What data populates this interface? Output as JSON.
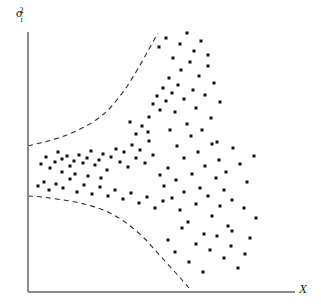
{
  "figure": {
    "width": 321,
    "height": 308,
    "background_color": "#ffffff"
  },
  "axes": {
    "y_axis": {
      "label_symbol": "σ",
      "label_superscript": "2",
      "label_subscript": "i",
      "label_full": "σ²ᵢ",
      "x": 28,
      "top": 32,
      "bottom": 292,
      "color": "#8a8a8a"
    },
    "x_axis": {
      "label": "X",
      "y": 292,
      "left": 28,
      "right": 295,
      "color": "#8a8a8a"
    }
  },
  "chart_data": {
    "type": "scatter",
    "title": "",
    "subtitle": "",
    "xlabel": "X",
    "ylabel": "σ²ᵢ",
    "xlim": [
      28,
      295
    ],
    "ylim": [
      292,
      32
    ],
    "grid": false,
    "legend": null,
    "annotations": [],
    "point_color": "#111111",
    "point_size": 3,
    "envelopes": {
      "style": "dashed",
      "color": "#2b2b2b",
      "upper": {
        "name": "upper-envelope",
        "points": [
          [
            28,
            146
          ],
          [
            40,
            143
          ],
          [
            52,
            140
          ],
          [
            64,
            136
          ],
          [
            76,
            131
          ],
          [
            88,
            125
          ],
          [
            100,
            117
          ],
          [
            110,
            108
          ],
          [
            120,
            96
          ],
          [
            128,
            85
          ],
          [
            136,
            72
          ],
          [
            143,
            60
          ],
          [
            149,
            49
          ],
          [
            154,
            40
          ],
          [
            158,
            33
          ]
        ]
      },
      "lower": {
        "name": "lower-envelope",
        "points": [
          [
            28,
            196
          ],
          [
            42,
            197
          ],
          [
            56,
            199
          ],
          [
            70,
            201
          ],
          [
            84,
            204
          ],
          [
            98,
            208
          ],
          [
            110,
            213
          ],
          [
            122,
            220
          ],
          [
            134,
            229
          ],
          [
            145,
            239
          ],
          [
            155,
            250
          ],
          [
            165,
            261
          ],
          [
            174,
            271
          ],
          [
            182,
            280
          ],
          [
            189,
            288
          ]
        ]
      }
    },
    "points": [
      [
        41,
        164
      ],
      [
        46,
        157
      ],
      [
        50,
        168
      ],
      [
        55,
        162
      ],
      [
        58,
        152
      ],
      [
        62,
        159
      ],
      [
        67,
        156
      ],
      [
        70,
        166
      ],
      [
        74,
        161
      ],
      [
        79,
        155
      ],
      [
        83,
        163
      ],
      [
        87,
        158
      ],
      [
        91,
        151
      ],
      [
        95,
        165
      ],
      [
        99,
        160
      ],
      [
        103,
        154
      ],
      [
        107,
        170
      ],
      [
        111,
        157
      ],
      [
        116,
        149
      ],
      [
        120,
        162
      ],
      [
        124,
        152
      ],
      [
        128,
        167
      ],
      [
        132,
        145
      ],
      [
        136,
        158
      ],
      [
        140,
        150
      ],
      [
        145,
        163
      ],
      [
        149,
        141
      ],
      [
        153,
        155
      ],
      [
        38,
        186
      ],
      [
        44,
        182
      ],
      [
        49,
        190
      ],
      [
        56,
        184
      ],
      [
        63,
        188
      ],
      [
        70,
        179
      ],
      [
        77,
        192
      ],
      [
        84,
        185
      ],
      [
        92,
        194
      ],
      [
        100,
        187
      ],
      [
        108,
        196
      ],
      [
        115,
        190
      ],
      [
        123,
        199
      ],
      [
        131,
        193
      ],
      [
        139,
        203
      ],
      [
        147,
        197
      ],
      [
        155,
        208
      ],
      [
        163,
        201
      ],
      [
        149,
        117
      ],
      [
        153,
        104
      ],
      [
        157,
        96
      ],
      [
        160,
        110
      ],
      [
        163,
        88
      ],
      [
        166,
        101
      ],
      [
        169,
        78
      ],
      [
        172,
        93
      ],
      [
        175,
        112
      ],
      [
        178,
        85
      ],
      [
        181,
        70
      ],
      [
        184,
        99
      ],
      [
        187,
        124
      ],
      [
        190,
        62
      ],
      [
        193,
        90
      ],
      [
        196,
        108
      ],
      [
        199,
        76
      ],
      [
        202,
        130
      ],
      [
        205,
        95
      ],
      [
        208,
        55
      ],
      [
        211,
        118
      ],
      [
        214,
        83
      ],
      [
        217,
        142
      ],
      [
        220,
        102
      ],
      [
        159,
        47
      ],
      [
        166,
        38
      ],
      [
        173,
        58
      ],
      [
        180,
        44
      ],
      [
        187,
        33
      ],
      [
        194,
        51
      ],
      [
        201,
        41
      ],
      [
        208,
        66
      ],
      [
        160,
        175
      ],
      [
        164,
        186
      ],
      [
        168,
        168
      ],
      [
        172,
        198
      ],
      [
        176,
        180
      ],
      [
        180,
        210
      ],
      [
        184,
        192
      ],
      [
        188,
        222
      ],
      [
        192,
        174
      ],
      [
        196,
        204
      ],
      [
        200,
        188
      ],
      [
        204,
        234
      ],
      [
        208,
        196
      ],
      [
        212,
        216
      ],
      [
        216,
        178
      ],
      [
        220,
        206
      ],
      [
        224,
        190
      ],
      [
        228,
        226
      ],
      [
        232,
        200
      ],
      [
        168,
        240
      ],
      [
        175,
        252
      ],
      [
        182,
        228
      ],
      [
        189,
        262
      ],
      [
        196,
        244
      ],
      [
        203,
        272
      ],
      [
        210,
        250
      ],
      [
        217,
        236
      ],
      [
        224,
        258
      ],
      [
        231,
        246
      ],
      [
        238,
        268
      ],
      [
        245,
        254
      ],
      [
        170,
        130
      ],
      [
        177,
        146
      ],
      [
        184,
        158
      ],
      [
        191,
        136
      ],
      [
        198,
        152
      ],
      [
        205,
        166
      ],
      [
        212,
        144
      ],
      [
        219,
        160
      ],
      [
        226,
        172
      ],
      [
        233,
        148
      ],
      [
        240,
        164
      ],
      [
        247,
        182
      ],
      [
        254,
        156
      ],
      [
        232,
        231
      ],
      [
        244,
        208
      ],
      [
        250,
        238
      ],
      [
        256,
        218
      ],
      [
        136,
        134
      ],
      [
        142,
        126
      ],
      [
        148,
        132
      ],
      [
        130,
        122
      ],
      [
        62,
        172
      ],
      [
        75,
        174
      ],
      [
        88,
        176
      ],
      [
        101,
        178
      ]
    ]
  }
}
